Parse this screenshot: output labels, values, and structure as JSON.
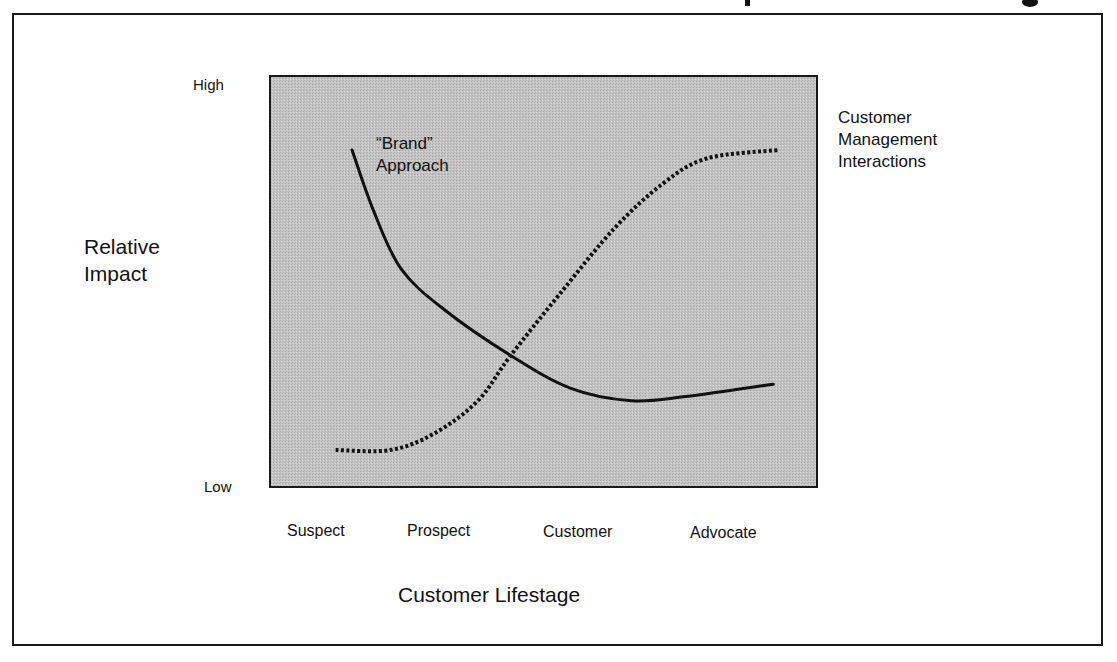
{
  "chart_data": {
    "type": "line",
    "title": "",
    "xlabel": "Customer Lifestage",
    "ylabel": "Relative Impact",
    "x_categories": [
      "Suspect",
      "Prospect",
      "Customer",
      "Advocate"
    ],
    "y_ticks": {
      "high": "High",
      "low": "Low"
    },
    "xlim": [
      0,
      1
    ],
    "ylim": [
      0,
      1
    ],
    "grid": false,
    "legend": "none",
    "series": [
      {
        "name": "“Brand” Approach",
        "label_lines": [
          "“Brand”",
          "Approach"
        ],
        "style": "solid",
        "points": [
          [
            0.15,
            0.82
          ],
          [
            0.19,
            0.67
          ],
          [
            0.24,
            0.53
          ],
          [
            0.32,
            0.43
          ],
          [
            0.44,
            0.32
          ],
          [
            0.55,
            0.24
          ],
          [
            0.66,
            0.21
          ],
          [
            0.76,
            0.22
          ],
          [
            0.92,
            0.25
          ]
        ]
      },
      {
        "name": "Customer Management Interactions",
        "label_lines": [
          "Customer",
          "Management",
          "Interactions"
        ],
        "style": "dotted",
        "points": [
          [
            0.12,
            0.09
          ],
          [
            0.22,
            0.09
          ],
          [
            0.3,
            0.13
          ],
          [
            0.38,
            0.21
          ],
          [
            0.44,
            0.32
          ],
          [
            0.53,
            0.47
          ],
          [
            0.63,
            0.63
          ],
          [
            0.72,
            0.74
          ],
          [
            0.8,
            0.8
          ],
          [
            0.93,
            0.82
          ]
        ]
      }
    ]
  },
  "colors": {
    "plot_fill": "#c3c3c3",
    "line": "#111111",
    "frame": "#1a1a1a"
  }
}
